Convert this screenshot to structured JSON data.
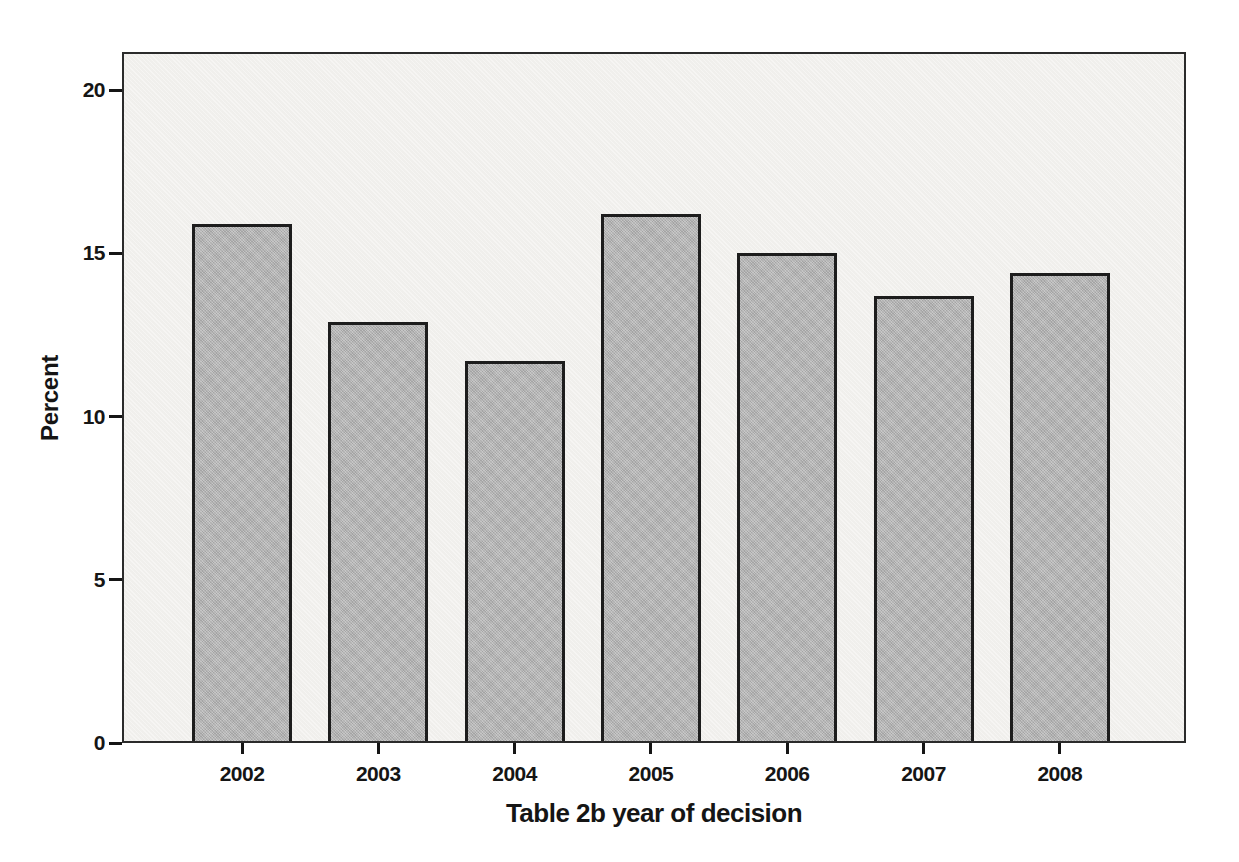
{
  "figure": {
    "page_background": "#ffffff"
  },
  "chart_data": {
    "type": "bar",
    "title": "",
    "categories": [
      "2002",
      "2003",
      "2004",
      "2005",
      "2006",
      "2007",
      "2008"
    ],
    "values": [
      15.9,
      12.9,
      11.7,
      16.2,
      15.0,
      13.7,
      14.4
    ],
    "xlabel": "Table 2b year of decision",
    "ylabel": "Percent",
    "yticks": [
      0,
      5,
      10,
      15,
      20
    ],
    "ylim": [
      0,
      21.2
    ],
    "grid": false,
    "legend": null,
    "colors": {
      "bar_fill": "#b4b4b4",
      "bar_border": "#1d1d1d",
      "plot_background": "#f3f2ef",
      "frame": "#2b2b2b",
      "text": "#151515"
    }
  }
}
